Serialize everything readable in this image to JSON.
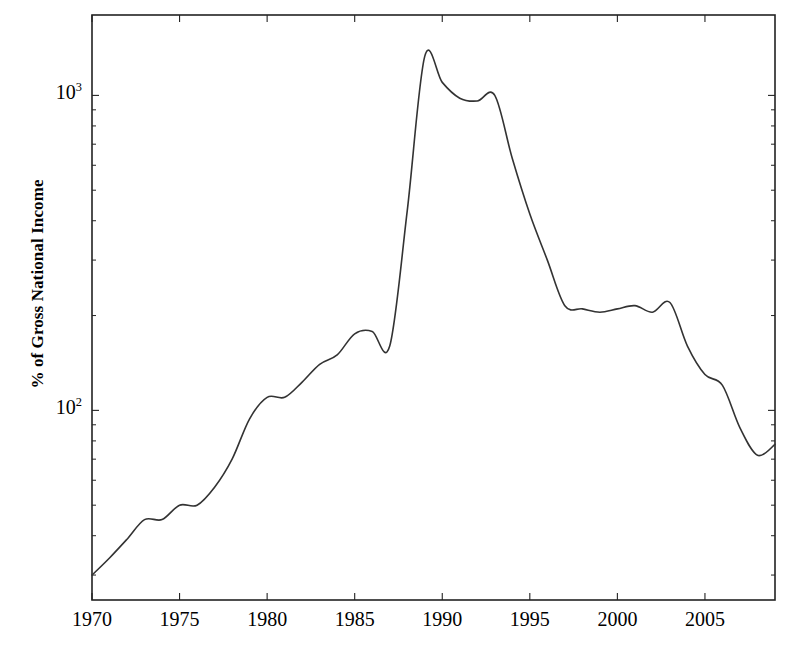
{
  "chart_data": {
    "type": "line",
    "title": "",
    "subtitle": "",
    "xlabel": "",
    "ylabel": "% of Gross National Income",
    "yscale": "log",
    "xscale": "linear",
    "xlim": [
      1970,
      2009
    ],
    "ylim": [
      25,
      1800
    ],
    "grid": false,
    "legend": null,
    "x_tick_labels": [
      "1970",
      "1975",
      "1980",
      "1985",
      "1990",
      "1995",
      "2000",
      "2005"
    ],
    "x_ticks": [
      1970,
      1975,
      1980,
      1985,
      1990,
      1995,
      2000,
      2005
    ],
    "y_tick_labels": [
      "10",
      "10"
    ],
    "y_ticks": [
      100,
      1000
    ],
    "y_tick_exponents": [
      "2",
      "3"
    ],
    "y_minor_ticks": [
      30,
      40,
      50,
      60,
      70,
      80,
      90,
      200,
      300,
      400,
      500,
      600,
      700,
      800,
      900,
      2000
    ],
    "line_color": "#333333",
    "line_width": 1.6,
    "frame_color": "#222222",
    "series": [
      {
        "name": "External debt",
        "x": [
          1970,
          1971,
          1972,
          1973,
          1974,
          1975,
          1976,
          1977,
          1978,
          1979,
          1980,
          1981,
          1982,
          1983,
          1984,
          1985,
          1986,
          1987,
          1988,
          1989,
          1990,
          1991,
          1992,
          1993,
          1994,
          1995,
          1996,
          1997,
          1998,
          1999,
          2000,
          2001,
          2002,
          2003,
          2004,
          2005,
          2006,
          2007,
          2008,
          2009
        ],
        "values": [
          30,
          34,
          39,
          45,
          45,
          50,
          50,
          57,
          70,
          94,
          110,
          110,
          123,
          140,
          150,
          175,
          178,
          160,
          430,
          1330,
          1100,
          980,
          960,
          1000,
          630,
          420,
          300,
          215,
          210,
          205,
          210,
          215,
          205,
          220,
          160,
          130,
          120,
          88,
          72,
          78
        ]
      }
    ]
  },
  "axis": {
    "y_title": "% of Gross National Income"
  },
  "y_labels": [
    {
      "mantissa": "10",
      "exponent": "3"
    },
    {
      "mantissa": "10",
      "exponent": "2"
    }
  ],
  "x_labels": [
    "1970",
    "1975",
    "1980",
    "1985",
    "1990",
    "1995",
    "2000",
    "2005"
  ]
}
